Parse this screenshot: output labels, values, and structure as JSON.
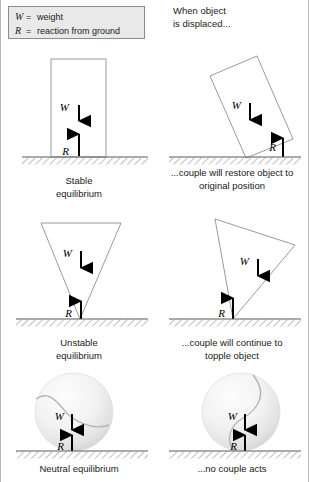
{
  "legend": {
    "rows": [
      {
        "symbol": "W",
        "equals": "=",
        "meaning": "weight"
      },
      {
        "symbol": "R",
        "equals": "=",
        "meaning": "reaction from ground"
      }
    ]
  },
  "header_note": "When object\nis displaced...",
  "labels": {
    "weight": "W",
    "reaction": "R"
  },
  "colors": {
    "legend_fill": "#e9e9e9",
    "legend_border": "#8c8c8c",
    "shape_stroke": "#9a9a9a",
    "arrow": "#000000",
    "ground_line": "#5a5a5a",
    "hatch": "#8d8d8d",
    "text": "#1a1a1a",
    "sphere_light": "#fdfdfd",
    "sphere_shade": "#d6d6d6"
  },
  "panels": [
    {
      "id": "stable-equilibrium",
      "shape": "rectangle-upright",
      "caption": "Stable\nequilibrium",
      "weight_label": "W",
      "reaction_label": "R"
    },
    {
      "id": "rectangle-displaced",
      "shape": "rectangle-tilted",
      "caption": "...couple will restore object to\noriginal position",
      "weight_label": "W",
      "reaction_label": "R"
    },
    {
      "id": "unstable-equilibrium",
      "shape": "triangle-inverted",
      "caption": "Unstable\nequilibrium",
      "weight_label": "W",
      "reaction_label": "R"
    },
    {
      "id": "triangle-displaced",
      "shape": "triangle-tilted",
      "caption": "...couple will continue to\ntopple object",
      "weight_label": "W",
      "reaction_label": "R"
    },
    {
      "id": "neutral-equilibrium",
      "shape": "sphere",
      "caption": "Neutral equilibrium",
      "weight_label": "W",
      "reaction_label": "R"
    },
    {
      "id": "sphere-displaced",
      "shape": "sphere-rotated",
      "caption": "...no couple acts",
      "weight_label": "W",
      "reaction_label": "R"
    }
  ]
}
